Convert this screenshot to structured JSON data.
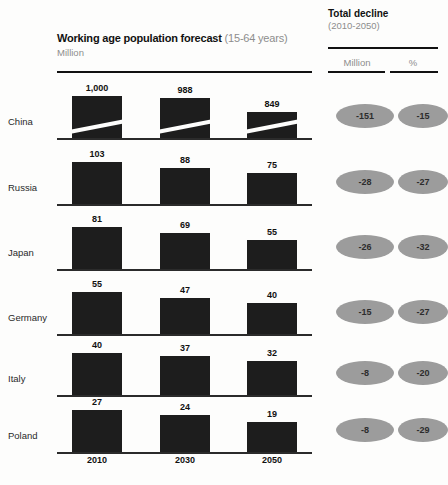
{
  "header": {
    "title_main": "Working age population forecast",
    "title_sub": "(15-64 years)",
    "unit": "Million",
    "right_title": "Total decline",
    "right_period": "(2010-2050)",
    "col_million": "Million",
    "col_percent": "%"
  },
  "axis": {
    "years": [
      "2010",
      "2030",
      "2050"
    ]
  },
  "chart_data": {
    "type": "bar",
    "title": "Working age population forecast (15-64 years)",
    "subtitle": "Million",
    "xlabel": "",
    "ylabel": "Million",
    "categories": [
      "2010",
      "2030",
      "2050"
    ],
    "grid": false,
    "legend": "none",
    "note": "Small-multiples: one horizontal panel per country, shared year categories. China panel uses a broken (truncated) value axis, indicated by a white diagonal slash across its bars.",
    "series": [
      {
        "name": "China",
        "values": [
          1000,
          988,
          849
        ],
        "labels": [
          "1,000",
          "988",
          "849"
        ],
        "axis_break": true,
        "total_decline_million": -151,
        "total_decline_percent": -15
      },
      {
        "name": "Russia",
        "values": [
          103,
          88,
          75
        ],
        "labels": [
          "103",
          "88",
          "75"
        ],
        "axis_break": false,
        "total_decline_million": -28,
        "total_decline_percent": -27
      },
      {
        "name": "Japan",
        "values": [
          81,
          69,
          55
        ],
        "labels": [
          "81",
          "69",
          "55"
        ],
        "axis_break": false,
        "total_decline_million": -26,
        "total_decline_percent": -32
      },
      {
        "name": "Germany",
        "values": [
          55,
          47,
          40
        ],
        "labels": [
          "55",
          "47",
          "40"
        ],
        "axis_break": false,
        "total_decline_million": -15,
        "total_decline_percent": -27
      },
      {
        "name": "Italy",
        "values": [
          40,
          37,
          32
        ],
        "labels": [
          "40",
          "37",
          "32"
        ],
        "axis_break": false,
        "total_decline_million": -8,
        "total_decline_percent": -20
      },
      {
        "name": "Poland",
        "values": [
          27,
          24,
          19
        ],
        "labels": [
          "27",
          "24",
          "19"
        ],
        "axis_break": false,
        "total_decline_million": -8,
        "total_decline_percent": -29
      }
    ]
  },
  "rows": [
    {
      "label": "China",
      "bars": [
        "1,000",
        "988",
        "849"
      ],
      "decline_million": "-151",
      "decline_percent": "-15"
    },
    {
      "label": "Russia",
      "bars": [
        "103",
        "88",
        "75"
      ],
      "decline_million": "-28",
      "decline_percent": "-27"
    },
    {
      "label": "Japan",
      "bars": [
        "81",
        "69",
        "55"
      ],
      "decline_million": "-26",
      "decline_percent": "-32"
    },
    {
      "label": "Germany",
      "bars": [
        "55",
        "47",
        "40"
      ],
      "decline_million": "-15",
      "decline_percent": "-27"
    },
    {
      "label": "Italy",
      "bars": [
        "40",
        "37",
        "32"
      ],
      "decline_million": "-8",
      "decline_percent": "-20"
    },
    {
      "label": "Poland",
      "bars": [
        "27",
        "24",
        "19"
      ],
      "decline_million": "-8",
      "decline_percent": "-29"
    }
  ],
  "colors": {
    "bar": "#1d1d1d",
    "pill": "#9c9c9c",
    "rule": "#111111",
    "muted_text": "#8d8d8d",
    "page": "#fdfdfc"
  }
}
